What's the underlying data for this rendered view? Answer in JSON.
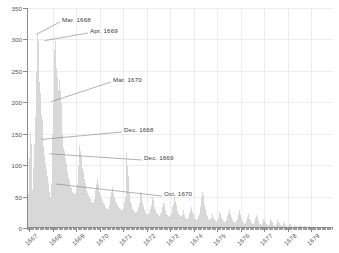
{
  "chart_data": {
    "type": "bar",
    "title": "",
    "subtitle": "",
    "xlabel": "",
    "ylabel": "",
    "ylim": [
      0,
      350
    ],
    "ytick_values": [
      0,
      50,
      100,
      150,
      200,
      250,
      300,
      350
    ],
    "ytick_labels": [
      "0",
      "50",
      "100",
      "150",
      "200",
      "250",
      "300",
      "350"
    ],
    "xlim": [
      "1667",
      "1680"
    ],
    "xtick_labels": [
      "1667",
      "1668",
      "1669",
      "1670",
      "1671",
      "1672",
      "1673",
      "1674",
      "1675",
      "1676",
      "1677",
      "1678",
      "1679"
    ],
    "grid": true,
    "legend": null,
    "bar_color": "#b4b4b4",
    "axis_color": "#8a8a8a",
    "grid_color": "#ededed",
    "series_name": "",
    "annotations": [
      {
        "label": "Mar. 1668",
        "x_index": 14,
        "y_value": 308,
        "label_x": 62,
        "label_y": 16
      },
      {
        "label": "Apr. 1669",
        "x_index": 27,
        "y_value": 298,
        "label_x": 90,
        "label_y": 27
      },
      {
        "label": "Mar. 1670",
        "x_index": 38,
        "y_value": 201,
        "label_x": 113,
        "label_y": 76
      },
      {
        "label": "Dec. 1668",
        "x_index": 23,
        "y_value": 141,
        "label_x": 124,
        "label_y": 126
      },
      {
        "label": "Dec. 1669",
        "x_index": 35,
        "y_value": 118,
        "label_x": 144,
        "label_y": 154
      },
      {
        "label": "Oct. 1670",
        "x_index": 45,
        "y_value": 70,
        "label_x": 164,
        "label_y": 190
      }
    ],
    "values": [
      4,
      18,
      54,
      112,
      152,
      136,
      133,
      129,
      60,
      95,
      88,
      133,
      79,
      177,
      222,
      248,
      308,
      298,
      262,
      232,
      215,
      196,
      180,
      172,
      141,
      130,
      122,
      116,
      103,
      96,
      92,
      83,
      78,
      72,
      66,
      58,
      50,
      46,
      70,
      108,
      150,
      198,
      240,
      283,
      298,
      288,
      254,
      241,
      228,
      220,
      232,
      236,
      218,
      199,
      176,
      150,
      133,
      128,
      122,
      118,
      112,
      104,
      96,
      90,
      86,
      80,
      76,
      70,
      66,
      63,
      60,
      58,
      56,
      55,
      54,
      54,
      55,
      58,
      64,
      72,
      85,
      99,
      118,
      130,
      123,
      114,
      104,
      96,
      90,
      84,
      78,
      72,
      66,
      62,
      58,
      55,
      52,
      50,
      48,
      46,
      44,
      42,
      41,
      40,
      40,
      42,
      46,
      52,
      60,
      70,
      78,
      74,
      68,
      62,
      57,
      53,
      50,
      47,
      44,
      42,
      40,
      38,
      36,
      34,
      33,
      32,
      31,
      30,
      30,
      32,
      36,
      42,
      50,
      58,
      66,
      62,
      56,
      50,
      46,
      43,
      40,
      38,
      36,
      34,
      33,
      32,
      31,
      30,
      29,
      28,
      28,
      29,
      32,
      36,
      42,
      50,
      120,
      112,
      98,
      82,
      68,
      56,
      48,
      42,
      38,
      34,
      31,
      29,
      27,
      26,
      25,
      24,
      24,
      25,
      27,
      30,
      34,
      40,
      48,
      58,
      54,
      46,
      40,
      35,
      31,
      28,
      26,
      24,
      23,
      22,
      21,
      21,
      22,
      24,
      27,
      31,
      36,
      42,
      50,
      44,
      38,
      33,
      29,
      26,
      24,
      22,
      21,
      20,
      19,
      19,
      20,
      22,
      25,
      29,
      34,
      40,
      38,
      33,
      29,
      26,
      23,
      21,
      20,
      19,
      18,
      18,
      19,
      21,
      24,
      28,
      33,
      38,
      44,
      50,
      42,
      36,
      31,
      27,
      24,
      22,
      20,
      19,
      18,
      18,
      19,
      21,
      24,
      28,
      20,
      18,
      16,
      15,
      14,
      14,
      15,
      17,
      20,
      24,
      28,
      33,
      30,
      26,
      22,
      19,
      17,
      15,
      14,
      13,
      13,
      14,
      16,
      19,
      23,
      28,
      34,
      41,
      49,
      58,
      52,
      44,
      37,
      31,
      26,
      22,
      19,
      17,
      15,
      14,
      13,
      13,
      14,
      16,
      19,
      23,
      16,
      14,
      12,
      11,
      10,
      10,
      11,
      13,
      16,
      20,
      25,
      22,
      19,
      16,
      14,
      12,
      11,
      10,
      9,
      9,
      10,
      12,
      15,
      19,
      24,
      30,
      26,
      22,
      18,
      15,
      13,
      11,
      10,
      9,
      8,
      8,
      9,
      11,
      14,
      18,
      23,
      29,
      24,
      20,
      16,
      13,
      11,
      9,
      8,
      7,
      7,
      8,
      10,
      13,
      17,
      22,
      18,
      15,
      12,
      10,
      8,
      7,
      6,
      6,
      7,
      9,
      12,
      16,
      21,
      17,
      14,
      11,
      9,
      7,
      6,
      5,
      5,
      6,
      8,
      11,
      15,
      12,
      10,
      8,
      6,
      5,
      4,
      4,
      5,
      7,
      10,
      14,
      11,
      9,
      7,
      5,
      4,
      3,
      3,
      4,
      6,
      9,
      13,
      10,
      8,
      6,
      5,
      4,
      3,
      3,
      4,
      6,
      9,
      7,
      5,
      4,
      3,
      2,
      2,
      3,
      5,
      7,
      6,
      4,
      3,
      2,
      2,
      2,
      3,
      5,
      4,
      3,
      2,
      2,
      1,
      2,
      3,
      5,
      4,
      3,
      2,
      1,
      1,
      2,
      3,
      4,
      3,
      2,
      1,
      1,
      1,
      2,
      3,
      2,
      1,
      1,
      1,
      1,
      2,
      3,
      2,
      1,
      1,
      1,
      1,
      2,
      2,
      1,
      1,
      1,
      1,
      1,
      2,
      2,
      1,
      1,
      1,
      1,
      1,
      1,
      2,
      1,
      1,
      1,
      1,
      1,
      1,
      1,
      1,
      1
    ]
  }
}
